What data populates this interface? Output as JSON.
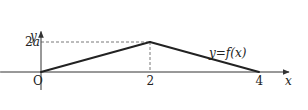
{
  "chart_data": {
    "type": "line",
    "title": "",
    "xlabel": "x",
    "ylabel": "y",
    "origin_label": "O",
    "curve_label": "y=f(x)",
    "points": [
      {
        "x": 0,
        "y": 0
      },
      {
        "x": 2,
        "y": 2
      },
      {
        "x": 4,
        "y": 0
      }
    ],
    "x_ticks": [
      {
        "value": 2,
        "label": "2"
      },
      {
        "value": 4,
        "label": "4"
      }
    ],
    "y_ticks": [
      {
        "value": 2,
        "label": "2a"
      }
    ],
    "xlim": [
      -0.75,
      4.55
    ],
    "ylim": [
      -1.2,
      2.7
    ],
    "guides": [
      {
        "from": {
          "x": 0,
          "y": 2
        },
        "to": {
          "x": 2,
          "y": 2
        },
        "style": "dashed"
      },
      {
        "from": {
          "x": 2,
          "y": 2
        },
        "to": {
          "x": 2,
          "y": 0
        },
        "style": "dashed"
      }
    ],
    "colors": {
      "curve": "#222222",
      "axis": "#333333",
      "guide": "#555555"
    }
  }
}
